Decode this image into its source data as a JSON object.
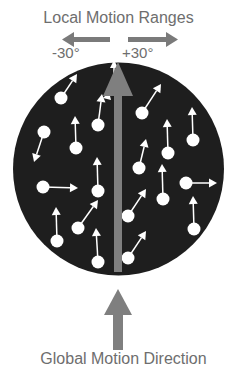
{
  "title": "Local Motion Ranges",
  "range_labels": {
    "negative": "-30°",
    "positive": "+30°"
  },
  "footer": "Global Motion Direction",
  "colors": {
    "field": "#1e1e1e",
    "dot": "#ffffff",
    "global_arrow": "#7f7f7f",
    "text": "#6e6e6e"
  },
  "dots": [
    {
      "x": 61,
      "y": 98,
      "tx": 77,
      "ty": 74
    },
    {
      "x": 98,
      "y": 125,
      "tx": 102,
      "ty": 94
    },
    {
      "x": 44,
      "y": 132,
      "tx": 34,
      "ty": 162
    },
    {
      "x": 76,
      "y": 148,
      "tx": 75,
      "ty": 116
    },
    {
      "x": 142,
      "y": 113,
      "tx": 161,
      "ty": 84
    },
    {
      "x": 168,
      "y": 153,
      "tx": 167,
      "ty": 119
    },
    {
      "x": 193,
      "y": 140,
      "tx": 192,
      "ty": 107
    },
    {
      "x": 139,
      "y": 168,
      "tx": 146,
      "ty": 139
    },
    {
      "x": 43,
      "y": 187,
      "tx": 78,
      "ty": 188
    },
    {
      "x": 98,
      "y": 191,
      "tx": 97,
      "ty": 157
    },
    {
      "x": 78,
      "y": 228,
      "tx": 98,
      "ty": 200
    },
    {
      "x": 57,
      "y": 241,
      "tx": 56,
      "ty": 207
    },
    {
      "x": 98,
      "y": 262,
      "tx": 96,
      "ty": 228
    },
    {
      "x": 163,
      "y": 199,
      "tx": 162,
      "ty": 164
    },
    {
      "x": 186,
      "y": 183,
      "tx": 217,
      "ty": 183
    },
    {
      "x": 194,
      "y": 229,
      "tx": 193,
      "ty": 196
    },
    {
      "x": 128,
      "y": 216,
      "tx": 146,
      "ty": 189
    },
    {
      "x": 128,
      "y": 258,
      "tx": 146,
      "ty": 231
    }
  ]
}
